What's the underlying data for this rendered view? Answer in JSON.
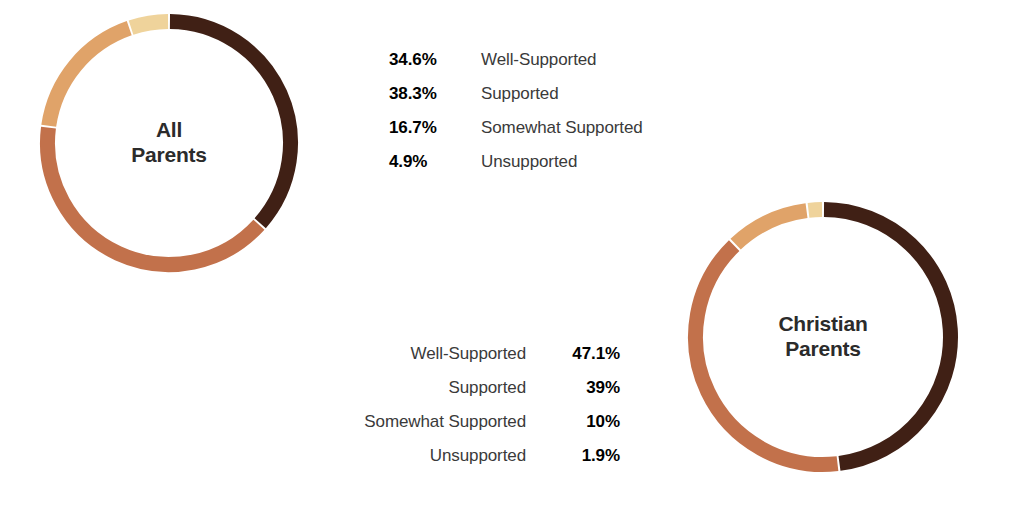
{
  "chart_data": [
    {
      "type": "pie",
      "variant": "donut",
      "title": "All Parents",
      "center_label_lines": [
        "All",
        "Parents"
      ],
      "categories": [
        "Well-Supported",
        "Supported",
        "Somewhat Supported",
        "Unsupported"
      ],
      "values": [
        34.6,
        38.3,
        16.7,
        4.9
      ],
      "value_labels": [
        "34.6%",
        "38.3%",
        "16.7%",
        "4.9%"
      ],
      "colors": [
        "#402015",
        "#C2714B",
        "#E0A369",
        "#EFD39B"
      ],
      "unit": "%",
      "start_angle_deg": 0,
      "direction": "clockwise",
      "legend_position": "right",
      "legend_order": [
        "percent",
        "label"
      ],
      "grid": false,
      "xlabel": "",
      "ylabel": ""
    },
    {
      "type": "pie",
      "variant": "donut",
      "title": "Christian Parents",
      "center_label_lines": [
        "Christian",
        "Parents"
      ],
      "categories": [
        "Well-Supported",
        "Supported",
        "Somewhat Supported",
        "Unsupported"
      ],
      "values": [
        47.1,
        39,
        10,
        1.9
      ],
      "value_labels": [
        "47.1%",
        "39%",
        "10%",
        "1.9%"
      ],
      "colors": [
        "#402015",
        "#C2714B",
        "#E0A369",
        "#EFD39B"
      ],
      "unit": "%",
      "start_angle_deg": 0,
      "direction": "clockwise",
      "legend_position": "left",
      "legend_order": [
        "label",
        "percent"
      ],
      "grid": false,
      "xlabel": "",
      "ylabel": ""
    }
  ],
  "palette": {
    "well_supported": "#402015",
    "supported": "#C2714B",
    "somewhat_supported": "#E0A369",
    "unsupported": "#EFD39B",
    "label_text": "#3a3a3a",
    "center_text": "#2b2b2b",
    "background": "#ffffff"
  },
  "charts": {
    "all_parents": {
      "center": {
        "line1": "All",
        "line2": "Parents"
      },
      "legend": [
        {
          "pct": "34.6%",
          "label": "Well-Supported",
          "color": "#402015"
        },
        {
          "pct": "38.3%",
          "label": "Supported",
          "color": "#C2714B"
        },
        {
          "pct": "16.7%",
          "label": "Somewhat Supported",
          "color": "#E0A369"
        },
        {
          "pct": "4.9%",
          "label": "Unsupported",
          "color": "#EFD39B"
        }
      ]
    },
    "christian_parents": {
      "center": {
        "line1": "Christian",
        "line2": "Parents"
      },
      "legend": [
        {
          "pct": "47.1%",
          "label": "Well-Supported",
          "color": "#402015"
        },
        {
          "pct": "39%",
          "label": "Supported",
          "color": "#C2714B"
        },
        {
          "pct": "10%",
          "label": "Somewhat Supported",
          "color": "#E0A369"
        },
        {
          "pct": "1.9%",
          "label": "Unsupported",
          "color": "#EFD39B"
        }
      ]
    }
  }
}
